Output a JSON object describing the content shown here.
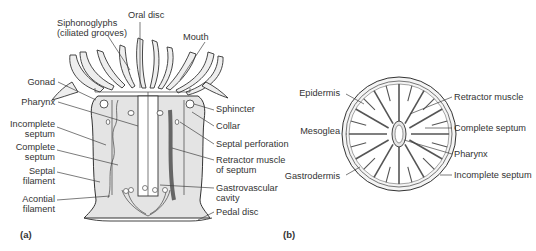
{
  "figure_a": {
    "panel_label": "(a)",
    "labels": {
      "siphonoglyphs_1": "Siphonoglyphs",
      "siphonoglyphs_2": "(ciliated grooves)",
      "oral_disc": "Oral disc",
      "mouth": "Mouth",
      "gonad": "Gonad",
      "pharynx": "Pharynx",
      "incomplete_septum_1": "Incomplete",
      "incomplete_septum_2": "septum",
      "complete_septum_1": "Complete",
      "complete_septum_2": "septum",
      "septal_filament_1": "Septal",
      "septal_filament_2": "filament",
      "acontial_filament_1": "Acontial",
      "acontial_filament_2": "filament",
      "sphincter": "Sphincter",
      "collar": "Collar",
      "septal_perforation": "Septal perforation",
      "retractor_muscle_1": "Retractor muscle",
      "retractor_muscle_2": "of septum",
      "gastrovascular_1": "Gastrovascular",
      "gastrovascular_2": "cavity",
      "pedal_disc": "Pedal disc"
    }
  },
  "figure_b": {
    "panel_label": "(b)",
    "labels": {
      "epidermis": "Epidermis",
      "mesoglea": "Mesoglea",
      "gastrodermis": "Gastrodermis",
      "retractor_muscle": "Retractor muscle",
      "complete_septum": "Complete septum",
      "pharynx": "Pharynx",
      "incomplete_septum": "Incomplete septum"
    }
  }
}
